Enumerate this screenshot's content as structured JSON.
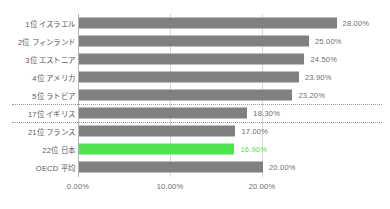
{
  "chart_data": {
    "type": "bar",
    "orientation": "horizontal",
    "title": "",
    "xlabel": "",
    "ylabel": "",
    "xlim": [
      0,
      30
    ],
    "grid": true,
    "legend": null,
    "value_suffix": "%",
    "categories": [
      "1位 イスラエル",
      "2位 フィンランド",
      "3位 エストニア",
      "4位 アメリカ",
      "5位 ラトビア",
      "17位 イギリス",
      "21位 フランス",
      "22位 日本",
      "OECD 平均"
    ],
    "values": [
      28.0,
      25.0,
      24.5,
      23.9,
      23.2,
      18.3,
      17.0,
      16.9,
      20.0
    ],
    "value_labels": [
      "28.00%",
      "25.00%",
      "24.50%",
      "23.90%",
      "23.20%",
      "18.30%",
      "17.00%",
      "16.90%",
      "20.00%"
    ],
    "highlight_index": 7,
    "tick_labels": [
      "0.00%",
      "10.00%",
      "20.00%"
    ],
    "tick_values": [
      0,
      10,
      20
    ],
    "separators_after_rows": [
      4,
      5
    ],
    "colors": {
      "bar": "#808080",
      "highlight": "#4FE34F",
      "grid": "#d8d8d8",
      "axis": "#b5b5b5",
      "text": "#6e6e6e",
      "label_text": "#5a5a5a",
      "background": "#ffffff",
      "separator": "#9a9a9a"
    }
  }
}
